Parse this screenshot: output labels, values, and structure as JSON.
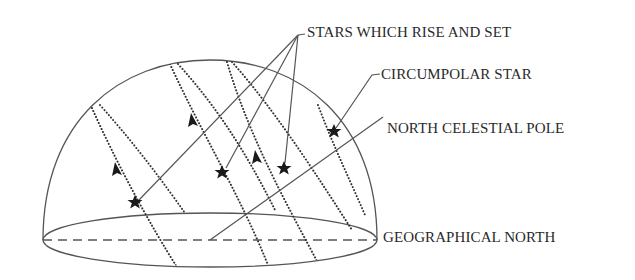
{
  "diagram": {
    "labels": {
      "rise_and_set": "STARS WHICH RISE AND SET",
      "circumpolar": "CIRCUMPOLAR STAR",
      "ncp": "NORTH CELESTIAL POLE",
      "geo_north": "GEOGRAPHICAL NORTH"
    },
    "colors": {
      "line": "#555555",
      "dots": "#333333",
      "text": "#2a2a2a",
      "star": "#1a1a1a"
    },
    "elements": {
      "hemisphere": "celestial hemisphere dome",
      "horizon": "horizon ellipse",
      "meridian": "dashed north-south line",
      "star_paths": 7,
      "stars": 4,
      "arrows": 3
    }
  }
}
